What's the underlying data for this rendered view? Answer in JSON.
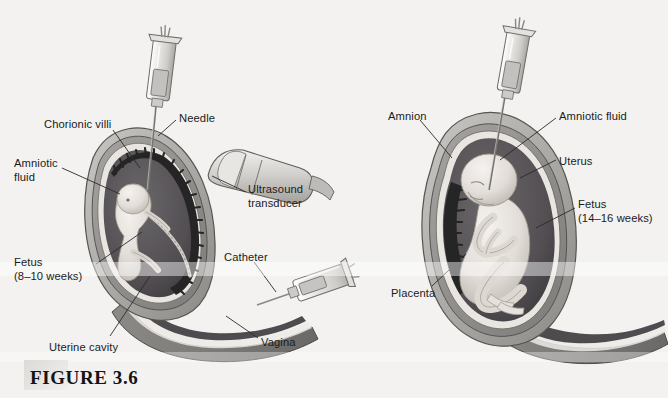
{
  "figure": {
    "caption": "FIGURE 3.6",
    "background_color": "#f3f2f0",
    "ink_color": "#1b1b1b"
  },
  "panels": [
    {
      "name": "chorionic-villus-sampling",
      "labels": [
        {
          "id": "chorionic-villi",
          "text": "Chorionic villi",
          "x": 44,
          "y": 118
        },
        {
          "id": "needle",
          "text": "Needle",
          "x": 179,
          "y": 112
        },
        {
          "id": "amniotic-fluid-left",
          "text": "Amniotic\nfluid",
          "x": 14,
          "y": 157
        },
        {
          "id": "ultrasound-transducer",
          "text": "Ultrasound\ntransducer",
          "x": 248,
          "y": 183
        },
        {
          "id": "fetus-left",
          "text": "Fetus\n(8–10 weeks)",
          "x": 14,
          "y": 256
        },
        {
          "id": "catheter",
          "text": "Catheter",
          "x": 224,
          "y": 251
        },
        {
          "id": "uterine-cavity",
          "text": "Uterine cavity",
          "x": 49,
          "y": 341
        },
        {
          "id": "vagina",
          "text": "Vagina",
          "x": 261,
          "y": 336
        }
      ]
    },
    {
      "name": "amniocentesis",
      "labels": [
        {
          "id": "amnion",
          "text": "Amnion",
          "x": 388,
          "y": 110
        },
        {
          "id": "amniotic-fluid-right",
          "text": "Amniotic fluid",
          "x": 559,
          "y": 110
        },
        {
          "id": "uterus",
          "text": "Uterus",
          "x": 559,
          "y": 155
        },
        {
          "id": "fetus-right",
          "text": "Fetus\n(14–16 weeks)",
          "x": 578,
          "y": 198
        },
        {
          "id": "placenta",
          "text": "Placenta",
          "x": 391,
          "y": 287
        }
      ]
    }
  ],
  "anatomy_colors": {
    "uterus_wall_outer": "#b9b7b4",
    "uterus_wall_mid": "#8e8c89",
    "amniotic_cavity": "#5a585a",
    "amniotic_cavity_dark": "#47464a",
    "fetus_skin": "#ebe7e3",
    "fetus_shade": "#c5bfba",
    "villi_dark": "#2b2a2a",
    "placenta_dark": "#262526",
    "inner_lining": "#e7e4e0",
    "leader_line": "#2a2a2a",
    "syringe_body": "#dedcd9",
    "syringe_outline": "#6e6c6a",
    "needle": "#7a7876",
    "transducer": "#cfcdcb"
  }
}
